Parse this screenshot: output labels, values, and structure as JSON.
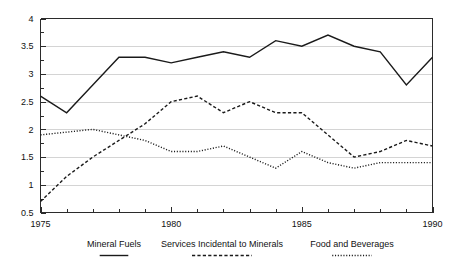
{
  "chart_data": {
    "type": "line",
    "title": "",
    "subtitle": "",
    "xlabel": "",
    "ylabel": "",
    "x": [
      1975,
      1976,
      1977,
      1978,
      1979,
      1980,
      1981,
      1982,
      1983,
      1984,
      1985,
      1986,
      1987,
      1988,
      1989,
      1990
    ],
    "xlim": [
      1975,
      1990
    ],
    "ylim": [
      0.5,
      4
    ],
    "xtick_labels": [
      "1975",
      "1980",
      "1985",
      "1990"
    ],
    "xtick_values": [
      1975,
      1980,
      1985,
      1990
    ],
    "ytick_labels": [
      "0.5",
      "1",
      "1.5",
      "2",
      "2.5",
      "3",
      "3.5",
      "4"
    ],
    "ytick_values": [
      0.5,
      1,
      1.5,
      2,
      2.5,
      3,
      3.5,
      4
    ],
    "minor_xticks": [
      1975,
      1976,
      1977,
      1978,
      1979,
      1980,
      1981,
      1982,
      1983,
      1984,
      1985,
      1986,
      1987,
      1988,
      1989,
      1990
    ],
    "grid": "horizontal",
    "grid_color": "#c9c9c9",
    "legend_position": "bottom",
    "series": [
      {
        "name": "Mineral Fuels",
        "style": "solid",
        "color": "#1a1a1a",
        "values": [
          2.6,
          2.3,
          2.8,
          3.3,
          3.3,
          3.2,
          3.3,
          3.4,
          3.3,
          3.6,
          3.5,
          3.7,
          3.5,
          3.4,
          2.8,
          3.3
        ]
      },
      {
        "name": "Services Incidental to Minerals",
        "style": "dashed",
        "color": "#1a1a1a",
        "values": [
          0.7,
          1.15,
          1.5,
          1.8,
          2.1,
          2.5,
          2.6,
          2.3,
          2.5,
          2.3,
          2.3,
          1.9,
          1.5,
          1.6,
          1.8,
          1.7
        ]
      },
      {
        "name": "Food and Beverages",
        "style": "dotted",
        "color": "#1a1a1a",
        "values": [
          1.9,
          1.95,
          2.0,
          1.9,
          1.8,
          1.6,
          1.6,
          1.7,
          1.5,
          1.3,
          1.6,
          1.4,
          1.3,
          1.4,
          1.4,
          1.4
        ]
      }
    ]
  },
  "legend": {
    "items": [
      {
        "label": "Mineral Fuels",
        "style": "solid"
      },
      {
        "label": "Services Incidental to Minerals",
        "style": "dashed"
      },
      {
        "label": "Food and Beverages",
        "style": "dotted"
      }
    ]
  },
  "axis": {
    "y_labels": [
      "4",
      "3.5",
      "3",
      "2.5",
      "2",
      "1.5",
      "1",
      "0.5"
    ],
    "x_labels": [
      "1975",
      "1980",
      "1985",
      "1990"
    ]
  }
}
